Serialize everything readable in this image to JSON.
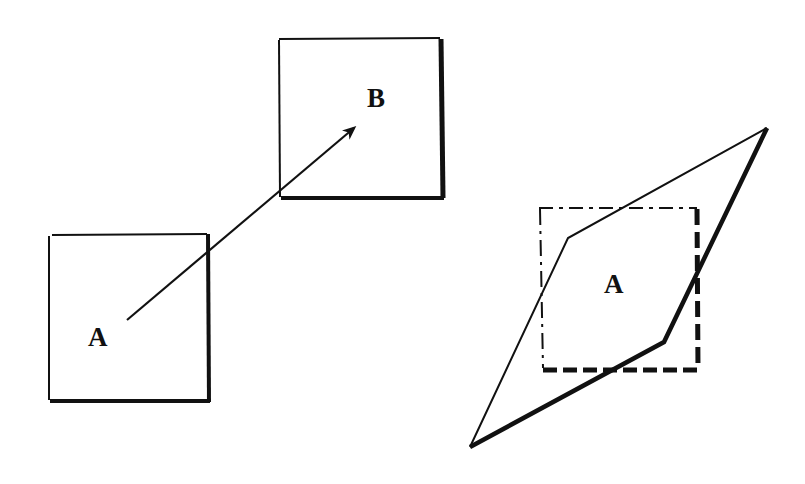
{
  "diagram": {
    "panels": [
      {
        "id": "translation",
        "description": "Square A translated to square B along an arrow",
        "shapes": {
          "square_a": {
            "label": "A",
            "x": 48,
            "y": 232,
            "w": 160,
            "h": 168
          },
          "square_b": {
            "label": "B",
            "x": 278,
            "y": 38,
            "w": 164,
            "h": 160
          },
          "arrow": {
            "from": [
              127,
              320
            ],
            "to": [
              356,
              127
            ]
          }
        }
      },
      {
        "id": "shear",
        "description": "Dashed square A overlaid with a sheared parallelogram",
        "shapes": {
          "dashed_square": {
            "label": "A",
            "x": 538,
            "y": 207,
            "w": 160,
            "h": 164
          },
          "parallelogram": {
            "points": [
              [
                767,
                128
              ],
              [
                664,
                342
              ],
              [
                470,
                447
              ],
              [
                568,
                238
              ]
            ]
          }
        }
      }
    ],
    "labels": {
      "square_a": "A",
      "square_b": "B",
      "sheared": "A"
    },
    "colors": {
      "stroke": "#111111",
      "background": "#ffffff"
    }
  }
}
